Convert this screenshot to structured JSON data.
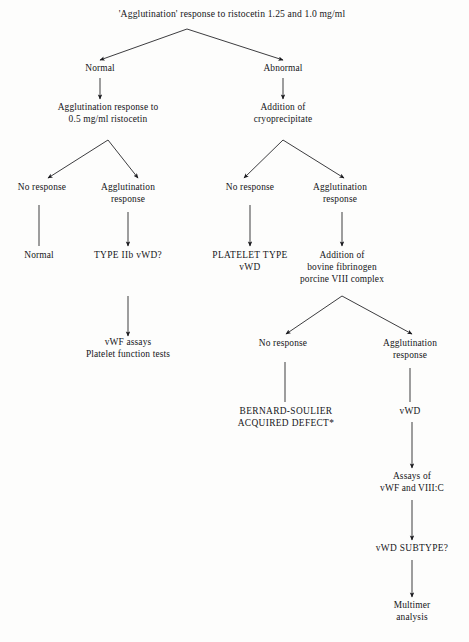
{
  "figure": {
    "type": "flowchart",
    "footnote_marker": "*"
  },
  "nodes": [
    {
      "id": "root",
      "lines": [
        "'Agglutination' response to ristocetin 1.25 and 1.0 mg/ml"
      ],
      "x": 232,
      "y": 17,
      "style": "title"
    },
    {
      "id": "normal-1",
      "lines": [
        "Normal"
      ],
      "x": 100,
      "y": 71,
      "style": "plain"
    },
    {
      "id": "abnormal-1",
      "lines": [
        "Abnormal"
      ],
      "x": 283,
      "y": 71,
      "style": "plain"
    },
    {
      "id": "agg-05",
      "lines": [
        "Agglutination response to",
        "0.5 mg/ml ristocetin"
      ],
      "x": 108,
      "y": 110,
      "style": "plain"
    },
    {
      "id": "add-cryo",
      "lines": [
        "Addition of",
        "cryoprecipitate"
      ],
      "x": 283,
      "y": 110,
      "style": "plain"
    },
    {
      "id": "no-resp-l",
      "lines": [
        "No response"
      ],
      "x": 42,
      "y": 190,
      "style": "plain"
    },
    {
      "id": "agg-resp-l",
      "lines": [
        "Agglutination",
        "response"
      ],
      "x": 128,
      "y": 190,
      "style": "plain"
    },
    {
      "id": "no-resp-r",
      "lines": [
        "No response"
      ],
      "x": 250,
      "y": 190,
      "style": "plain"
    },
    {
      "id": "agg-resp-r",
      "lines": [
        "Agglutination",
        "response"
      ],
      "x": 340,
      "y": 190,
      "style": "plain"
    },
    {
      "id": "normal-2",
      "lines": [
        "Normal"
      ],
      "x": 39,
      "y": 258,
      "style": "plain"
    },
    {
      "id": "type-iib",
      "lines": [
        "TYPE IIb vWD?"
      ],
      "x": 128,
      "y": 258,
      "style": "caps"
    },
    {
      "id": "platelet-type",
      "lines": [
        "PLATELET TYPE",
        "vWD"
      ],
      "x": 250,
      "y": 258,
      "style": "caps"
    },
    {
      "id": "add-bovine",
      "lines": [
        "Addition of",
        "bovine fibrinogen",
        "porcine VIII complex"
      ],
      "x": 342,
      "y": 258,
      "style": "plain"
    },
    {
      "id": "vwf-assays",
      "lines": [
        "vWF assays",
        "Platelet function tests"
      ],
      "x": 128,
      "y": 345,
      "style": "plain"
    },
    {
      "id": "no-resp-b",
      "lines": [
        "No response"
      ],
      "x": 283,
      "y": 346,
      "style": "plain"
    },
    {
      "id": "agg-resp-b",
      "lines": [
        "Agglutination",
        "response"
      ],
      "x": 410,
      "y": 346,
      "style": "plain"
    },
    {
      "id": "bernard",
      "lines": [
        "BERNARD-SOULIER",
        "ACQUIRED DEFECT*"
      ],
      "x": 286,
      "y": 414,
      "style": "caps"
    },
    {
      "id": "vwd",
      "lines": [
        "vWD"
      ],
      "x": 410,
      "y": 414,
      "style": "plain"
    },
    {
      "id": "assays-of",
      "lines": [
        "Assays of",
        "vWF and VIII:C"
      ],
      "x": 412,
      "y": 479,
      "style": "plain"
    },
    {
      "id": "vwd-subtype",
      "lines": [
        "vWD SUBTYPE?"
      ],
      "x": 412,
      "y": 551,
      "style": "caps"
    },
    {
      "id": "multimer",
      "lines": [
        "Multimer",
        "analysis"
      ],
      "x": 412,
      "y": 608,
      "style": "plain"
    }
  ],
  "edges": [
    {
      "id": "e-root-normal",
      "from": "root",
      "to": "normal-1",
      "kind": "elbow-arrow",
      "path": "M 187 29 L 100 60",
      "apex": true
    },
    {
      "id": "e-root-abnormal",
      "from": "root",
      "to": "abnormal-1",
      "kind": "elbow-arrow",
      "path": "M 187 29 L 283 60",
      "apex": true
    },
    {
      "id": "e-normal-agg05",
      "from": "normal-1",
      "to": "agg-05",
      "kind": "arrow",
      "path": "M 100 78 L 100 99"
    },
    {
      "id": "e-abnormal-cryo",
      "from": "abnormal-1",
      "to": "add-cryo",
      "kind": "arrow",
      "path": "M 283 78 L 283 99"
    },
    {
      "id": "e-agg05-noresp",
      "from": "agg-05",
      "to": "no-resp-l",
      "kind": "elbow-arrow",
      "path": "M 108 140 L 48 178"
    },
    {
      "id": "e-agg05-aggresp",
      "from": "agg-05",
      "to": "agg-resp-l",
      "kind": "elbow-arrow",
      "path": "M 108 140 L 138 178"
    },
    {
      "id": "e-cryo-noresp",
      "from": "add-cryo",
      "to": "no-resp-r",
      "kind": "elbow-arrow",
      "path": "M 283 140 L 244 178"
    },
    {
      "id": "e-cryo-aggresp",
      "from": "add-cryo",
      "to": "agg-resp-r",
      "kind": "elbow-arrow",
      "path": "M 283 140 L 344 178"
    },
    {
      "id": "e-norespl-normal2",
      "from": "no-resp-l",
      "to": "normal-2",
      "kind": "line",
      "path": "M 39 205 L 39 246"
    },
    {
      "id": "e-aggrespl-typeiib",
      "from": "agg-resp-l",
      "to": "type-iib",
      "kind": "arrow",
      "path": "M 128 212 L 128 246"
    },
    {
      "id": "e-noresp-platelet",
      "from": "no-resp-r",
      "to": "platelet-type",
      "kind": "arrow",
      "path": "M 250 205 L 250 246"
    },
    {
      "id": "e-aggrespr-bovine",
      "from": "agg-resp-r",
      "to": "add-bovine",
      "kind": "arrow",
      "path": "M 342 212 L 342 246"
    },
    {
      "id": "e-typeiib-vwfassays",
      "from": "type-iib",
      "to": "vwf-assays",
      "kind": "arrow",
      "path": "M 128 296 L 128 336"
    },
    {
      "id": "e-bovine-noresp",
      "from": "add-bovine",
      "to": "no-resp-b",
      "kind": "elbow-arrow",
      "path": "M 342 296 L 286 334"
    },
    {
      "id": "e-bovine-aggresp",
      "from": "add-bovine",
      "to": "agg-resp-b",
      "kind": "elbow-arrow",
      "path": "M 342 296 L 412 334"
    },
    {
      "id": "e-norespb-bernard",
      "from": "no-resp-b",
      "to": "bernard",
      "kind": "line",
      "path": "M 285 362 L 285 402"
    },
    {
      "id": "e-aggrespb-vwd",
      "from": "agg-resp-b",
      "to": "vwd",
      "kind": "line",
      "path": "M 410 368 L 410 402"
    },
    {
      "id": "e-vwd-assays",
      "from": "vwd",
      "to": "assays-of",
      "kind": "arrow",
      "path": "M 412 422 L 412 468"
    },
    {
      "id": "e-assays-subtype",
      "from": "assays-of",
      "to": "vwd-subtype",
      "kind": "arrow",
      "path": "M 412 500 L 412 540"
    },
    {
      "id": "e-subtype-multimer",
      "from": "vwd-subtype",
      "to": "multimer",
      "kind": "arrow",
      "path": "M 412 560 L 412 597"
    }
  ],
  "colors": {
    "background": "#fdfdfc",
    "ink": "#16161a",
    "stroke": "#1a1a1e"
  }
}
